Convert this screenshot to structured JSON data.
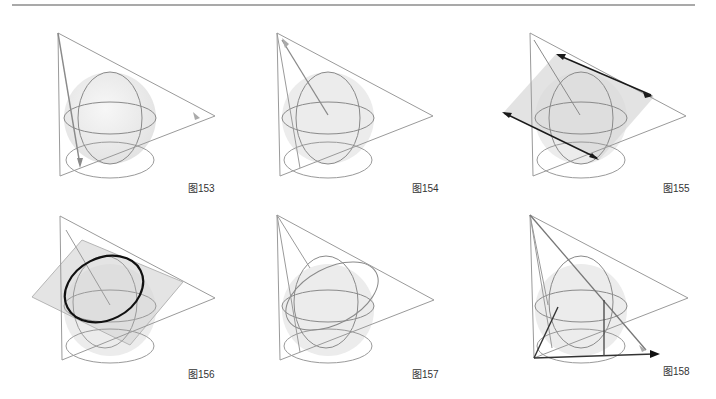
{
  "figures": [
    {
      "id": "fig153",
      "caption": "图153"
    },
    {
      "id": "fig154",
      "caption": "图154"
    },
    {
      "id": "fig155",
      "caption": "图155"
    },
    {
      "id": "fig156",
      "caption": "图156"
    },
    {
      "id": "fig157",
      "caption": "图157"
    },
    {
      "id": "fig158",
      "caption": "图158"
    }
  ],
  "colors": {
    "line": "#9a9a9a",
    "dark": "#1a1a1a",
    "sphere": "#ececec",
    "plane": "#d9d9d9"
  }
}
